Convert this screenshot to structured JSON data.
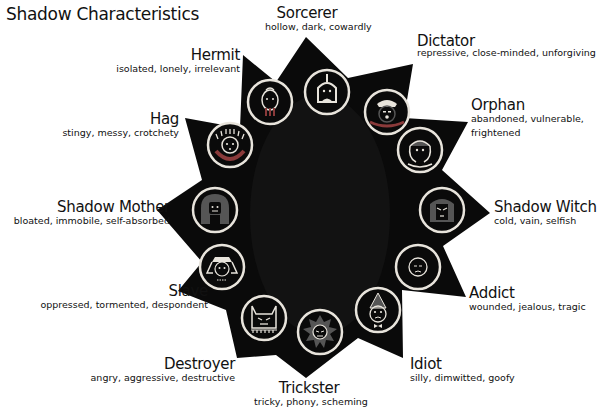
{
  "title": "Shadow Characteristics",
  "colors": {
    "star": "#0a0a0a",
    "ring": "#e8e4dc",
    "icon_fill": "#555555",
    "background": "#ffffff"
  },
  "archetypes": [
    {
      "name": "Sorcerer",
      "traits": "hollow, dark, cowardly",
      "icon": "sorcerer-face-icon"
    },
    {
      "name": "Dictator",
      "traits": "repressive, close-minded, unforgiving",
      "icon": "dictator-face-icon"
    },
    {
      "name": "Orphan",
      "traits": "abandoned, vulnerable,",
      "traits2": "frightened",
      "icon": "orphan-face-icon"
    },
    {
      "name": "Shadow Witch",
      "traits": "cold, vain, selfish",
      "icon": "shadow-witch-face-icon"
    },
    {
      "name": "Addict",
      "traits": "wounded, jealous, tragic",
      "icon": "addict-face-icon"
    },
    {
      "name": "Idiot",
      "traits": "silly, dimwitted, goofy",
      "icon": "idiot-face-icon"
    },
    {
      "name": "Trickster",
      "traits": "tricky, phony, scheming",
      "icon": "trickster-face-icon"
    },
    {
      "name": "Destroyer",
      "traits": "angry, aggressive, destructive",
      "icon": "destroyer-face-icon"
    },
    {
      "name": "Slave",
      "traits": "oppressed, tormented, despondent",
      "icon": "slave-face-icon"
    },
    {
      "name": "Shadow Mother",
      "traits": "bloated, immobile, self-absorbed",
      "icon": "shadow-mother-face-icon"
    },
    {
      "name": "Hag",
      "traits": "stingy, messy, crotchety",
      "icon": "hag-face-icon"
    },
    {
      "name": "Hermit",
      "traits": "isolated, lonely, irrelevant",
      "icon": "hermit-face-icon"
    }
  ]
}
